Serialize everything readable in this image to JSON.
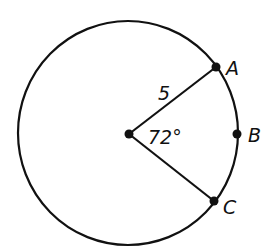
{
  "diagram": {
    "type": "circle-sector",
    "colors": {
      "stroke": "#111111",
      "background": "#ffffff"
    },
    "circle": {
      "cx": 128,
      "cy": 133,
      "rx": 110,
      "ry": 112
    },
    "center": {
      "x": 129,
      "y": 134
    },
    "points": [
      {
        "name": "A",
        "x": 216,
        "y": 67,
        "label": "A"
      },
      {
        "name": "B",
        "x": 237,
        "y": 134,
        "label": "B"
      },
      {
        "name": "C",
        "x": 214,
        "y": 201,
        "label": "C"
      }
    ],
    "radius_label": "5",
    "angle_label": "72°"
  }
}
